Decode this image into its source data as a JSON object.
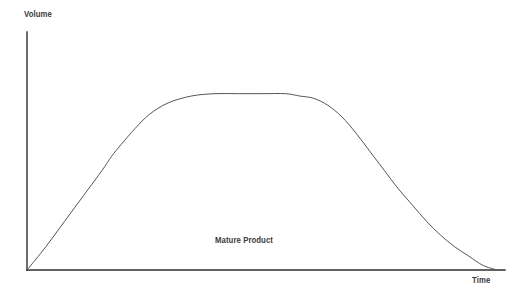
{
  "chart_data": {
    "type": "line",
    "title": "",
    "subtitle": "",
    "xlabel": "Time",
    "ylabel": "Volume",
    "grid": false,
    "legend": null,
    "xlim": [
      0,
      100
    ],
    "ylim": [
      0,
      100
    ],
    "axis_ticks": {
      "x": [],
      "y": []
    },
    "annotations": [
      {
        "text": "Mature Product",
        "x": 39,
        "y": 14
      }
    ],
    "series": [
      {
        "name": "Product life cycle volume",
        "x": [
          0,
          4,
          8,
          12,
          16,
          18,
          20,
          23,
          26,
          30,
          35,
          40,
          45,
          50,
          55,
          58,
          61,
          64,
          67,
          70,
          73,
          76,
          79,
          82,
          85,
          88,
          91,
          94,
          97,
          100
        ],
        "y": [
          0,
          10,
          21,
          32,
          43,
          49,
          54,
          61,
          67,
          72,
          75,
          76,
          76,
          76,
          76,
          75,
          74,
          71,
          66,
          59,
          51,
          43,
          35,
          28,
          21,
          15,
          10,
          6,
          2,
          0
        ]
      }
    ]
  },
  "chart_geometry": {
    "origin": {
      "x": 27,
      "y": 270
    },
    "y_axis_top": 32,
    "x_axis_right": 505,
    "curve_path": "M 27,270 C 45,246 62,222 79,197 C 92,178 104,160 117,149 C 131,137 146,133 163,132 C 190,130 218,131 245,131 C 272,131 296,132 311,134 C 323,136 333,142 341,152 C 352,165 360,181 370,196 C 383,215 398,235 415,249 C 435,264 467,269 497,270 L 505,270",
    "axis_color": "#2e2e2e",
    "curve_color": "#555555",
    "background_color": "#ffffff",
    "axis_width": 1.4,
    "curve_width": 1.0
  },
  "labels": {
    "y_axis": "Volume",
    "x_axis": "Time",
    "annotation": "Mature Product"
  }
}
